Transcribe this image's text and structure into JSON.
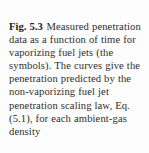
{
  "figure": {
    "label": "Fig. 5.3",
    "caption": "Measured penetration data as a function of time for vaporizing fuel jets (the symbols). The curves give the penetration predicted by the non-vaporizing fuel jet penetration scaling law, Eq. (5.1), for each ambient-gas density",
    "lines": [
      "Fig. 5.3  Measured",
      "penetration data as a function",
      "of time for vaporizing fuel",
      "jets (the symbols). The curves",
      "give the penetration predicted",
      "by the non-vaporizing fuel jet",
      "penetration scaling law,",
      "Eq. (5.1), for each",
      "ambient-gas density"
    ],
    "equation_reference": "Eq. (5.1)",
    "colors": {
      "background": "#fdfdfd",
      "label_text": "#1c1c1c",
      "body_text": "#2e2e2e"
    }
  }
}
